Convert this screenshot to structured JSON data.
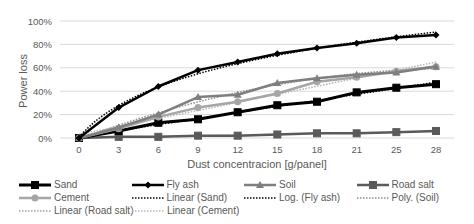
{
  "chart_data": {
    "type": "line",
    "title": "",
    "xlabel": "Dust concentracion [g/panel]",
    "ylabel": "Power loss",
    "x": [
      0,
      3,
      6,
      9,
      12,
      15,
      18,
      21,
      25,
      28
    ],
    "x_tick_labels": [
      "0",
      "3",
      "6",
      "9",
      "12",
      "15",
      "18",
      "21",
      "25",
      "28"
    ],
    "y_tick_labels": [
      "0%",
      "20%",
      "40%",
      "60%",
      "80%",
      "100%"
    ],
    "ylim": [
      0,
      100
    ],
    "grid": true,
    "legend_position": "bottom",
    "series": [
      {
        "name": "Sand",
        "values": [
          0,
          6,
          13,
          16,
          22,
          28,
          31,
          39,
          43,
          46
        ],
        "color": "#000000",
        "marker": "square",
        "width": 3
      },
      {
        "name": "Fly ash",
        "values": [
          0,
          26,
          44,
          58,
          65,
          72,
          77,
          81,
          86,
          88
        ],
        "color": "#000000",
        "marker": "diamond",
        "width": 2.5
      },
      {
        "name": "Soil",
        "values": [
          0,
          9,
          20,
          35,
          37,
          47,
          51,
          54,
          56,
          61
        ],
        "color": "#7f7f7f",
        "marker": "triangle",
        "width": 2.5
      },
      {
        "name": "Road salt",
        "values": [
          0,
          1,
          1,
          2,
          2,
          3,
          4,
          4,
          5,
          6
        ],
        "color": "#5a5a5a",
        "marker": "square",
        "width": 2.5
      },
      {
        "name": "Cement",
        "values": [
          0,
          8,
          18,
          26,
          31,
          38,
          48,
          52,
          57,
          61
        ],
        "color": "#a6a6a6",
        "marker": "circle",
        "width": 2.5
      }
    ],
    "trendlines": [
      {
        "name": "Linear (Sand)",
        "type": "linear",
        "of": "Sand",
        "color": "#000000"
      },
      {
        "name": "Log. (Fly ash)",
        "type": "log",
        "of": "Fly ash",
        "color": "#000000"
      },
      {
        "name": "Poly. (Soil)",
        "type": "poly",
        "of": "Soil",
        "color": "#8c8c8c"
      },
      {
        "name": "Linear (Road salt)",
        "type": "linear",
        "of": "Road salt",
        "color": "#a0a0a0"
      },
      {
        "name": "Linear (Cement)",
        "type": "linear",
        "of": "Cement",
        "color": "#b5b5b5"
      }
    ]
  },
  "legend": {
    "rows": [
      [
        "Sand",
        "Fly ash",
        "Soil",
        "Road salt"
      ],
      [
        "Cement",
        "Linear (Sand)",
        "Log. (Fly ash)",
        "Poly. (Soil)"
      ],
      [
        "Linear (Road salt)",
        "Linear (Cement)"
      ]
    ]
  }
}
